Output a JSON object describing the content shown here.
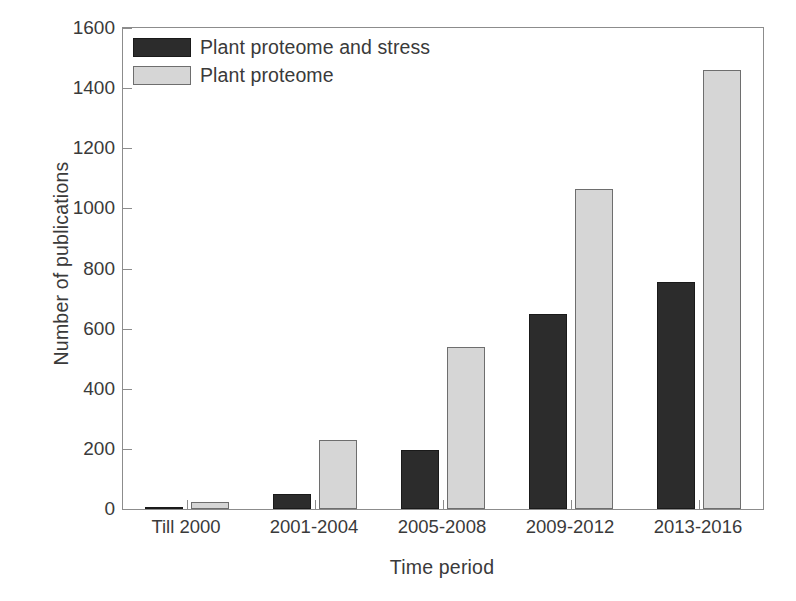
{
  "chart_data": {
    "type": "bar",
    "title": "",
    "xlabel": "Time period",
    "ylabel": "Number of publications",
    "categories": [
      "Till 2000",
      "2001-2004",
      "2005-2008",
      "2009-2012",
      "2013-2016"
    ],
    "series": [
      {
        "name": "Plant proteome and stress",
        "color": "#2c2c2c",
        "values": [
          2,
          50,
          195,
          650,
          755
        ]
      },
      {
        "name": "Plant proteome",
        "color": "#d6d6d6",
        "values": [
          22,
          228,
          540,
          1065,
          1460
        ]
      }
    ],
    "ylim": [
      0,
      1600
    ],
    "yticks": [
      0,
      200,
      400,
      600,
      800,
      1000,
      1200,
      1400,
      1600
    ],
    "ytick_labels": [
      "0",
      "200",
      "400",
      "600",
      "800",
      "1000",
      "1200",
      "1400",
      "1600"
    ],
    "grid": false,
    "legend_position": "top-left",
    "frame": true
  }
}
